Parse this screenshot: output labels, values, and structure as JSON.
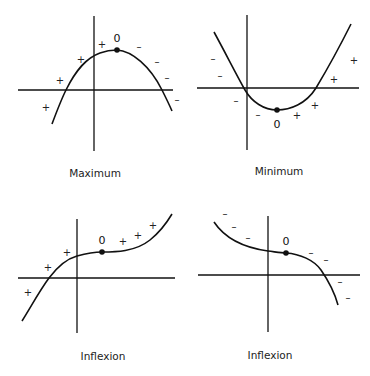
{
  "panels": [
    {
      "id": "maximum",
      "caption": "Maximum",
      "stationary_label": "0",
      "signs_left": [
        "+",
        "+",
        "+",
        "+"
      ],
      "signs_right": [
        "–",
        "–",
        "–",
        "–"
      ],
      "description": "Curve rises to a peak then falls; slope signs + before point, – after"
    },
    {
      "id": "minimum",
      "caption": "Minimum",
      "stationary_label": "0",
      "signs_left": [
        "–",
        "–",
        "–",
        "–"
      ],
      "signs_right": [
        "+",
        "+",
        "+",
        "+"
      ],
      "description": "Curve falls to a trough then rises; slope signs – before point, + after"
    },
    {
      "id": "inflexion-rising",
      "caption": "Inflexion",
      "stationary_label": "0",
      "signs_left": [
        "+",
        "+",
        "+"
      ],
      "signs_right": [
        "+",
        "+",
        "+"
      ],
      "description": "Curve rises, flattens at point, continues rising; slope + on both sides"
    },
    {
      "id": "inflexion-falling",
      "caption": "Inflexion",
      "stationary_label": "0",
      "signs_left": [
        "–",
        "–",
        "–"
      ],
      "signs_right": [
        "–",
        "–",
        "–",
        "–"
      ],
      "description": "Curve falls, flattens at point, continues falling; slope – on both sides"
    }
  ]
}
